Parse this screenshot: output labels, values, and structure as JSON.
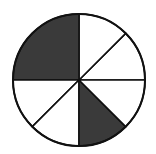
{
  "diagram": {
    "type": "fraction-circle",
    "center": [
      79,
      80
    ],
    "radius": 66,
    "stroke_color": "#111111",
    "shaded_color": "#3a3a3a",
    "unshaded_color": "#ffffff",
    "total_parts_eighths": 8,
    "shaded_eighths": 3,
    "sectors": [
      {
        "start_deg": 0,
        "end_deg": 45,
        "shaded": false
      },
      {
        "start_deg": 45,
        "end_deg": 90,
        "shaded": false
      },
      {
        "start_deg": 90,
        "end_deg": 180,
        "shaded": true
      },
      {
        "start_deg": 180,
        "end_deg": 225,
        "shaded": false
      },
      {
        "start_deg": 225,
        "end_deg": 270,
        "shaded": false
      },
      {
        "start_deg": 270,
        "end_deg": 315,
        "shaded": true
      },
      {
        "start_deg": 315,
        "end_deg": 360,
        "shaded": false
      }
    ]
  }
}
